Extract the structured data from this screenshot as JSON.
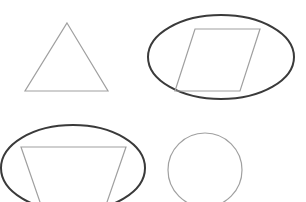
{
  "diagram": {
    "width": 306,
    "height": 202,
    "background": "#ffffff",
    "shape_stroke": "#a0a0a0",
    "highlight_stroke": "#3a3a3a",
    "shapes": [
      {
        "name": "triangle",
        "points": "67,23 108,91 25,91",
        "highlighted": false
      },
      {
        "name": "parallelogram",
        "points": "195,29 260,29 240,91 175,91",
        "highlighted": true
      },
      {
        "name": "trapezoid",
        "points": "21,147 126,147 106,205 41,205",
        "highlighted": true
      },
      {
        "name": "circle",
        "cx": 205,
        "cy": 170,
        "r": 37,
        "highlighted": false
      }
    ],
    "highlight_ellipses": [
      {
        "name": "ellipse-around-parallelogram",
        "cx": 221,
        "cy": 57,
        "rx": 73,
        "ry": 42
      },
      {
        "name": "ellipse-around-trapezoid",
        "cx": 73,
        "cy": 168,
        "rx": 72,
        "ry": 43
      }
    ]
  }
}
